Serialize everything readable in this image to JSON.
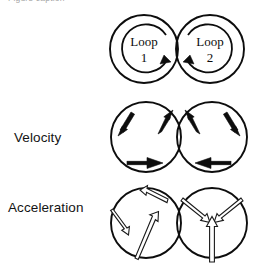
{
  "figure": {
    "clipped_top_caption": "Figure caption",
    "rows": [
      {
        "id": "loops",
        "label": "",
        "circles": [
          {
            "name": "Loop",
            "number": "1",
            "rotation": "clockwise"
          },
          {
            "name": "Loop",
            "number": "2",
            "rotation": "counterclockwise"
          }
        ]
      },
      {
        "id": "velocity",
        "label": "Velocity",
        "circles": [
          {
            "vectors": [
              {
                "position": "upper-left",
                "direction": "down-left"
              },
              {
                "position": "upper-right",
                "direction": "up-right"
              },
              {
                "position": "bottom",
                "direction": "right"
              }
            ]
          },
          {
            "vectors": [
              {
                "position": "upper-left",
                "direction": "up-left"
              },
              {
                "position": "upper-right",
                "direction": "down-right"
              },
              {
                "position": "bottom",
                "direction": "left"
              }
            ]
          }
        ]
      },
      {
        "id": "acceleration",
        "label": "Acceleration",
        "circles": [
          {
            "vectors": [
              {
                "position": "top",
                "direction": "up-left"
              },
              {
                "position": "left",
                "direction": "down-left"
              },
              {
                "position": "bottom",
                "direction": "up-right"
              }
            ]
          },
          {
            "vectors": [
              {
                "position": "upper-left",
                "direction": "down-right"
              },
              {
                "position": "upper-right",
                "direction": "down-left"
              },
              {
                "position": "bottom",
                "direction": "up"
              }
            ]
          }
        ]
      }
    ],
    "colors": {
      "stroke": "#0d0d0d",
      "background": "#ffffff",
      "label": "#141414",
      "hollow_arrow_fill": "#ffffff"
    }
  }
}
